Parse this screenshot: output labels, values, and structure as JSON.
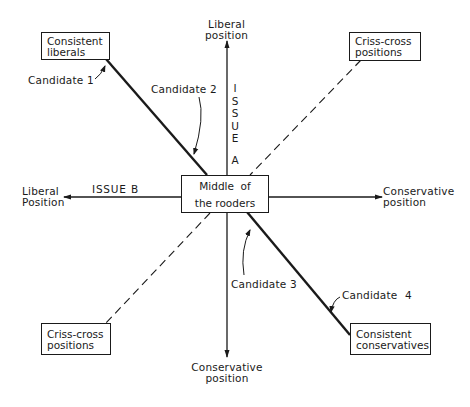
{
  "diagram": {
    "axes": {
      "vertical": {
        "name": "ISSUE A",
        "letters": [
          "I",
          "S",
          "S",
          "U",
          "E"
        ],
        "suffix": "A",
        "top_label_line1": "Liberal",
        "top_label_line2": "position",
        "bottom_label_line1": "Conservative",
        "bottom_label_line2": "position"
      },
      "horizontal": {
        "name": "ISSUE B",
        "left_label_line1": "Liberal",
        "left_label_line2": "Position",
        "right_label_line1": "Conservative",
        "right_label_line2": "position"
      }
    },
    "center_box": {
      "line1": "Middle  of",
      "line2": "the rooders"
    },
    "corner_boxes": {
      "top_left": {
        "line1": "Consistent",
        "line2": "liberals"
      },
      "top_right": {
        "line1": "Criss-cross",
        "line2": "positions"
      },
      "bottom_left": {
        "line1": "Criss-cross",
        "line2": "positions"
      },
      "bottom_right": {
        "line1": "Consistent",
        "line2": "conservatives"
      }
    },
    "candidates": [
      {
        "label": "Candidate 1"
      },
      {
        "label": "Candidate 2"
      },
      {
        "label": "Candidate 3"
      },
      {
        "label": "Candidate 4"
      }
    ],
    "colors": {
      "ink": "#1a1a1a",
      "background": "#ffffff"
    }
  }
}
